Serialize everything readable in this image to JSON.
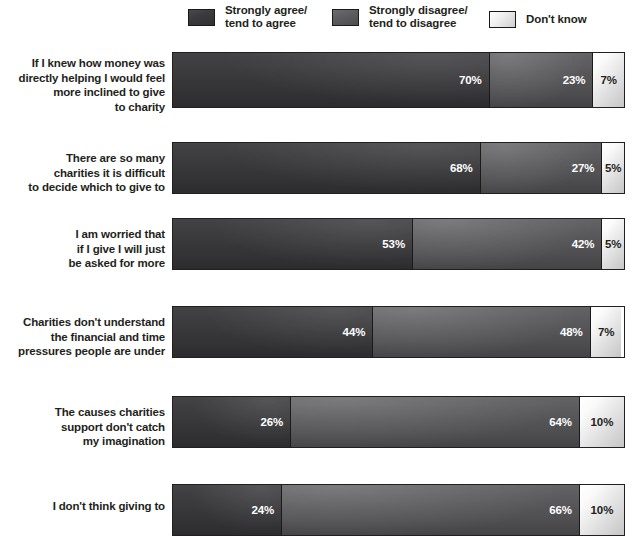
{
  "legend": {
    "items": [
      {
        "label": "Strongly agree/\ntend to agree",
        "key": "agree",
        "color": "#3a3a3c"
      },
      {
        "label": "Strongly disagree/\ntend to disagree",
        "key": "disagree",
        "color": "#58585b"
      },
      {
        "label": "Don't know",
        "key": "dont_know",
        "color": "#d6d6d6"
      }
    ]
  },
  "chart_data": {
    "type": "bar",
    "orientation": "horizontal",
    "stacked": true,
    "stack_total": 100,
    "title": "",
    "subtitle": "",
    "xlabel": "",
    "ylabel": "",
    "xlim": [
      0,
      100
    ],
    "grid": false,
    "legend_position": "top",
    "value_suffix": "%",
    "categories": [
      "If I knew how money was directly helping I would feel more inclined to give to charity",
      "There are so many charities it is difficult to decide which to give to",
      "I am worried that if I give I will just be asked for more",
      "Charities don't understand the financial and time pressures people are under",
      "The causes charities support don't catch my imagination",
      "I don't think giving to"
    ],
    "series": [
      {
        "name": "Strongly agree/tend to agree",
        "key": "agree",
        "color": "#3a3a3c",
        "values": [
          70,
          68,
          53,
          44,
          26,
          24
        ]
      },
      {
        "name": "Strongly disagree/tend to disagree",
        "key": "disagree",
        "color": "#58585b",
        "values": [
          23,
          27,
          42,
          48,
          64,
          66
        ]
      },
      {
        "name": "Don't know",
        "key": "dont_know",
        "color": "#d6d6d6",
        "values": [
          7,
          5,
          5,
          7,
          10,
          10
        ]
      }
    ]
  },
  "rows": [
    {
      "label_lines": [
        "If I knew how money was",
        "directly helping I would feel",
        "more inclined to give",
        "to charity"
      ],
      "values": {
        "agree": "70%",
        "disagree": "23%",
        "dont_know": "7%"
      },
      "pct": {
        "agree": 70,
        "disagree": 23,
        "dont_know": 7
      }
    },
    {
      "label_lines": [
        "There are so many",
        "charities it is difficult",
        "to decide which to give to"
      ],
      "values": {
        "agree": "68%",
        "disagree": "27%",
        "dont_know": "5%"
      },
      "pct": {
        "agree": 68,
        "disagree": 27,
        "dont_know": 5
      }
    },
    {
      "label_lines": [
        "I am worried that",
        "if I give I will just",
        "be asked for more"
      ],
      "values": {
        "agree": "53%",
        "disagree": "42%",
        "dont_know": "5%"
      },
      "pct": {
        "agree": 53,
        "disagree": 42,
        "dont_know": 5
      }
    },
    {
      "label_lines": [
        "Charities don't understand",
        "the financial and time",
        "pressures people are under"
      ],
      "values": {
        "agree": "44%",
        "disagree": "48%",
        "dont_know": "7%"
      },
      "pct": {
        "agree": 44,
        "disagree": 48,
        "dont_know": 7
      }
    },
    {
      "label_lines": [
        "The causes charities",
        "support don't catch",
        "my imagination"
      ],
      "values": {
        "agree": "26%",
        "disagree": "64%",
        "dont_know": "10%"
      },
      "pct": {
        "agree": 26,
        "disagree": 64,
        "dont_know": 10
      }
    },
    {
      "label_lines": [
        "I don't think giving to"
      ],
      "values": {
        "agree": "24%",
        "disagree": "66%",
        "dont_know": "10%"
      },
      "pct": {
        "agree": 24,
        "disagree": 66,
        "dont_know": 10
      }
    }
  ],
  "layout": {
    "row_tops": [
      8,
      98,
      174,
      262,
      352,
      440
    ],
    "bar_tops": [
      8,
      98,
      174,
      262,
      352,
      440
    ],
    "bar_heights": [
      56,
      52,
      52,
      52,
      52,
      52
    ],
    "label_tops": [
      12,
      107,
      183,
      271,
      361,
      455
    ]
  }
}
